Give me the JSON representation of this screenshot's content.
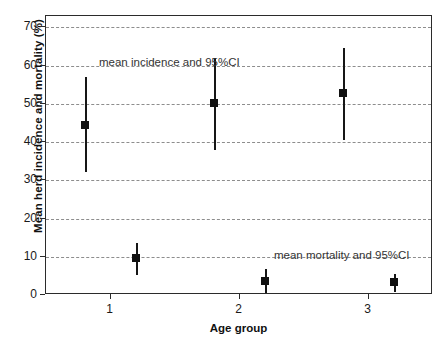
{
  "chart_data": {
    "type": "scatter",
    "title": "",
    "xlabel": "Age group",
    "ylabel": "Mean herd incidence and mortality (%)",
    "ylim": [
      0,
      73
    ],
    "xlim": [
      0.5,
      3.5
    ],
    "grid": true,
    "legend_position": "none",
    "yticks": [
      0,
      10,
      20,
      30,
      40,
      50,
      60,
      70
    ],
    "ytick_labels": [
      "0",
      "10",
      "20",
      "30",
      "40",
      "50",
      "60",
      "70"
    ],
    "xticks": [
      1,
      2,
      3
    ],
    "xtick_labels": [
      "1",
      "2",
      "3"
    ],
    "annotations": [
      {
        "text": "mean incidence and 95%CI",
        "x": 0.72,
        "y": 66.5
      },
      {
        "text": "mean mortality and 95%CI",
        "x": 2.14,
        "y": 15.8
      }
    ],
    "categories": [
      "1",
      "2",
      "3"
    ],
    "series": [
      {
        "name": "mean incidence and 95%CI",
        "marker": "square",
        "x": [
          0.8,
          1.8,
          2.8
        ],
        "values": [
          44.5,
          50.2,
          52.8
        ],
        "ci_low": [
          32.3,
          38.0,
          40.5
        ],
        "ci_high": [
          57.0,
          62.0,
          64.5
        ]
      },
      {
        "name": "mean mortality and 95%CI",
        "marker": "square",
        "x": [
          1.2,
          2.2,
          3.2
        ],
        "values": [
          9.8,
          3.6,
          3.3
        ],
        "ci_low": [
          5.2,
          0.6,
          0.8
        ],
        "ci_high": [
          13.7,
          6.8,
          5.5
        ]
      }
    ]
  },
  "colors": {
    "marker": "#111111",
    "axis": "#2b2b2b",
    "grid": "#8d8d8d",
    "background": "#ffffff"
  }
}
